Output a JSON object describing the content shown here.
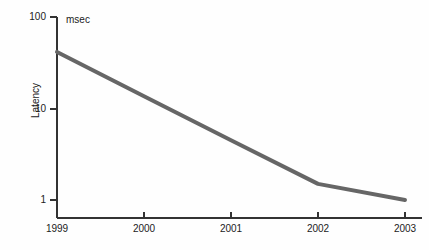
{
  "chart_data": {
    "type": "line",
    "title": "",
    "subtitle": "",
    "xlabel": "",
    "ylabel": "Latency",
    "unit_annotation": "msec",
    "yscale": "log",
    "xscale": "linear",
    "grid": false,
    "legend": null,
    "xlim": [
      1999,
      2003
    ],
    "ylim": [
      1,
      100
    ],
    "xticks": [
      1999,
      2000,
      2001,
      2002,
      2003
    ],
    "xtick_labels": [
      "1999",
      "2000",
      "2001",
      "2002",
      "2003"
    ],
    "yticks": [
      1,
      10,
      100
    ],
    "ytick_labels": [
      "1",
      "10",
      "100"
    ],
    "series": [
      {
        "name": "Latency",
        "color": "#666666",
        "linewidth": 4,
        "x": [
          1999,
          2000,
          2001,
          2002,
          2003
        ],
        "values": [
          41.5,
          13.6,
          4.5,
          1.5,
          1.0
        ]
      }
    ]
  },
  "axes": {
    "y_axis_name": "latency-axis",
    "x_axis_name": "year-axis"
  }
}
